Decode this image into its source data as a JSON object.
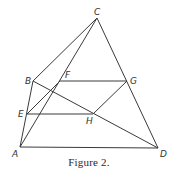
{
  "figure": {
    "caption": "Figure 2.",
    "stroke_color": "#3a3a3a",
    "points": {
      "A": {
        "label": "A",
        "x": 20,
        "y": 147
      },
      "B": {
        "label": "B",
        "x": 33,
        "y": 81
      },
      "C": {
        "label": "C",
        "x": 97,
        "y": 18
      },
      "D": {
        "label": "D",
        "x": 158,
        "y": 148
      },
      "E": {
        "label": "E",
        "x": 27,
        "y": 114
      },
      "F": {
        "label": "F",
        "x": 60,
        "y": 81
      },
      "G": {
        "label": "G",
        "x": 127,
        "y": 81
      },
      "H": {
        "label": "H",
        "x": 93,
        "y": 114
      }
    },
    "segments": [
      [
        "A",
        "B"
      ],
      [
        "B",
        "C"
      ],
      [
        "A",
        "C"
      ],
      [
        "C",
        "D"
      ],
      [
        "A",
        "D"
      ],
      [
        "B",
        "D"
      ],
      [
        "E",
        "F"
      ],
      [
        "F",
        "G"
      ],
      [
        "G",
        "H"
      ],
      [
        "H",
        "E"
      ]
    ]
  }
}
